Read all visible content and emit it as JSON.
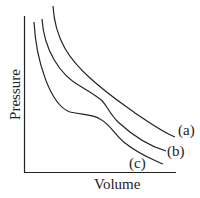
{
  "diagram": {
    "xlabel": "Volume",
    "ylabel": "Pressure",
    "curves": [
      {
        "label": "(a)",
        "description": "isotherm, smooth hyperbola-like"
      },
      {
        "label": "(b)",
        "description": "isotherm with inflection"
      },
      {
        "label": "(c)",
        "description": "isotherm with flat plateau region"
      }
    ],
    "line_color": "#222222"
  }
}
